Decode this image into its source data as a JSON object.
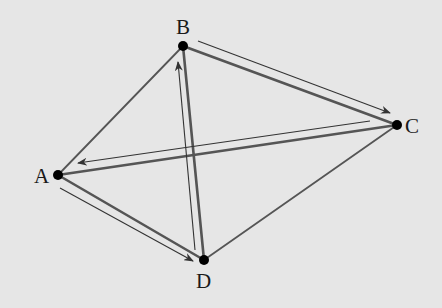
{
  "diagram": {
    "background": "#e6e6e6",
    "edge_color": "#555555",
    "arrow_color": "#333333",
    "vertex_color": "#000000",
    "vertices": [
      {
        "id": "A",
        "label": "A",
        "x": 58,
        "y": 175,
        "label_x": 34,
        "label_y": 183
      },
      {
        "id": "B",
        "label": "B",
        "x": 183,
        "y": 46,
        "label_x": 176,
        "label_y": 34
      },
      {
        "id": "C",
        "label": "C",
        "x": 397,
        "y": 125,
        "label_x": 405,
        "label_y": 133
      },
      {
        "id": "D",
        "label": "D",
        "x": 204,
        "y": 260,
        "label_x": 196,
        "label_y": 288
      }
    ],
    "edges": [
      {
        "from": "A",
        "to": "B",
        "weight": "thin"
      },
      {
        "from": "B",
        "to": "C",
        "weight": "thick"
      },
      {
        "from": "C",
        "to": "A",
        "weight": "thick"
      },
      {
        "from": "A",
        "to": "D",
        "weight": "thick"
      },
      {
        "from": "D",
        "to": "B",
        "weight": "thick"
      },
      {
        "from": "C",
        "to": "D",
        "weight": "thin"
      }
    ],
    "arrows": [
      {
        "from": "B",
        "to": "C",
        "x1": 198,
        "y1": 41,
        "x2": 390,
        "y2": 113
      },
      {
        "from": "C",
        "to": "A",
        "x1": 370,
        "y1": 121,
        "x2": 78,
        "y2": 163
      },
      {
        "from": "A",
        "to": "D",
        "x1": 60,
        "y1": 188,
        "x2": 193,
        "y2": 261
      },
      {
        "from": "D",
        "to": "B",
        "x1": 195,
        "y1": 250,
        "x2": 178,
        "y2": 62
      }
    ]
  }
}
